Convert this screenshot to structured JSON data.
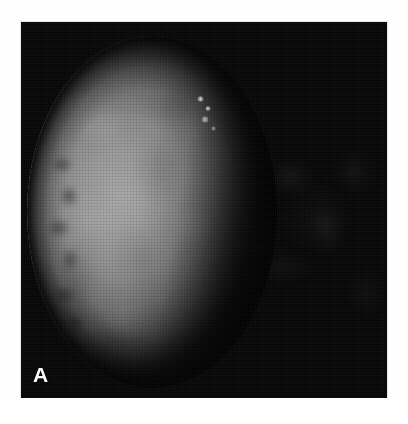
{
  "figure": {
    "panel_label": "A",
    "caption": "",
    "background_color": "#ffffff",
    "plate_color": "#050505",
    "label_color": "#fdfdfd"
  },
  "image": {
    "subject": "planetary-disc",
    "phase": "gibbous",
    "illumination_direction": "left",
    "capture_mode": "grayscale",
    "brightest_gray": "#a8a8a8",
    "midtone_gray": "#8a8a8a",
    "shadow_gray": "#131313",
    "features": [
      {
        "name": "illuminated-limb",
        "position": "left"
      },
      {
        "name": "terminator",
        "position": "right-of-center"
      },
      {
        "name": "dark-limb-band",
        "position": "west-limb"
      },
      {
        "name": "bright-spot",
        "position": "upper-terminator"
      },
      {
        "name": "bright-spot",
        "position": "upper-terminator"
      },
      {
        "name": "surface-mottling",
        "position": "disc-center"
      },
      {
        "name": "night-side-mottling",
        "position": "right"
      }
    ]
  }
}
